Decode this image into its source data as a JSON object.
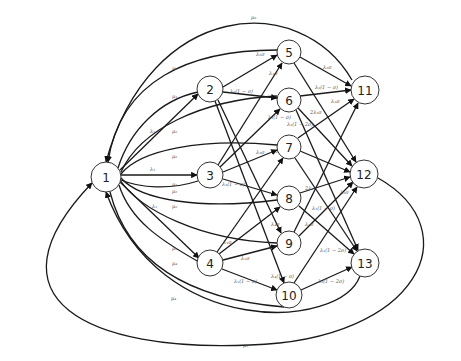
{
  "diagram": {
    "type": "state-transition-graph",
    "nodes": [
      {
        "id": "1",
        "label": "1",
        "x": 106,
        "y": 177,
        "r": 15
      },
      {
        "id": "2",
        "label": "2",
        "x": 210,
        "y": 89,
        "r": 13
      },
      {
        "id": "3",
        "label": "3",
        "x": 210,
        "y": 175,
        "r": 13
      },
      {
        "id": "4",
        "label": "4",
        "x": 210,
        "y": 263,
        "r": 13
      },
      {
        "id": "5",
        "label": "5",
        "x": 289,
        "y": 52,
        "r": 12
      },
      {
        "id": "6",
        "label": "6",
        "x": 289,
        "y": 100,
        "r": 12
      },
      {
        "id": "7",
        "label": "7",
        "x": 289,
        "y": 147,
        "r": 12
      },
      {
        "id": "8",
        "label": "8",
        "x": 289,
        "y": 198,
        "r": 12
      },
      {
        "id": "9",
        "label": "9",
        "x": 289,
        "y": 243,
        "r": 12
      },
      {
        "id": "10",
        "label": "10",
        "x": 289,
        "y": 295,
        "r": 13
      },
      {
        "id": "11",
        "label": "11",
        "x": 365,
        "y": 90,
        "r": 14
      },
      {
        "id": "12",
        "label": "12",
        "x": 364,
        "y": 174,
        "r": 14
      },
      {
        "id": "13",
        "label": "13",
        "x": 365,
        "y": 263,
        "r": 14
      }
    ],
    "edges": [
      {
        "from": "1",
        "to": "2",
        "label": "λ₁",
        "lx": 150,
        "ly": 133
      },
      {
        "from": "1",
        "to": "3",
        "label": "λ₁",
        "lx": 150,
        "ly": 171
      },
      {
        "from": "1",
        "to": "4",
        "label": "λ₁",
        "lx": 152,
        "ly": 208
      },
      {
        "from": "2",
        "to": "1",
        "label": "μ₁",
        "lx": 172,
        "ly": 98
      },
      {
        "from": "3",
        "to": "1",
        "label": "μ₁",
        "lx": 172,
        "ly": 186
      },
      {
        "from": "4",
        "to": "1",
        "label": "μ₁",
        "lx": 172,
        "ly": 250
      },
      {
        "from": "5",
        "to": "1",
        "label": "μ₂",
        "lx": 172,
        "ly": 70
      },
      {
        "from": "6",
        "to": "1",
        "label": "μ₂",
        "lx": 172,
        "ly": 133
      },
      {
        "from": "7",
        "to": "1",
        "label": "μ₂",
        "lx": 172,
        "ly": 158
      },
      {
        "from": "8",
        "to": "1",
        "label": "μ₂",
        "lx": 172,
        "ly": 193
      },
      {
        "from": "9",
        "to": "1",
        "label": "μ₂",
        "lx": 172,
        "ly": 208
      },
      {
        "from": "10",
        "to": "1",
        "label": "μ₄",
        "lx": 172,
        "ly": 265
      },
      {
        "from": "11",
        "to": "1",
        "label": "μ₃",
        "lx": 251,
        "ly": 19
      },
      {
        "from": "12",
        "to": "1",
        "label": "μ₃",
        "lx": 243,
        "ly": 347
      },
      {
        "from": "13",
        "to": "1",
        "label": "μ₄",
        "lx": 171,
        "ly": 300
      },
      {
        "from": "2",
        "to": "5",
        "label": "λ₂σ",
        "lx": 256,
        "ly": 56
      },
      {
        "from": "2",
        "to": "6",
        "label": "λ₂(1 − σ)",
        "lx": 230,
        "ly": 93
      },
      {
        "from": "2",
        "to": "9",
        "label": "",
        "lx": 0,
        "ly": 0
      },
      {
        "from": "2",
        "to": "10",
        "label": "",
        "lx": 0,
        "ly": 0
      },
      {
        "from": "3",
        "to": "5",
        "label": "λ₁σ",
        "lx": 269,
        "ly": 75
      },
      {
        "from": "3",
        "to": "6",
        "label": "λ₁(1 − σ)",
        "lx": 268,
        "ly": 119
      },
      {
        "from": "3",
        "to": "7",
        "label": "λ₃σ",
        "lx": 256,
        "ly": 154
      },
      {
        "from": "3",
        "to": "8",
        "label": "λ₃(1 − σ)",
        "lx": 222,
        "ly": 186
      },
      {
        "from": "4",
        "to": "7",
        "label": "λ₁σ",
        "lx": 223,
        "ly": 244
      },
      {
        "from": "4",
        "to": "8",
        "label": "",
        "lx": 0,
        "ly": 0
      },
      {
        "from": "4",
        "to": "9",
        "label": "λ₁σ",
        "lx": 241,
        "ly": 260
      },
      {
        "from": "4",
        "to": "10",
        "label": "λ₁(1 − σ)",
        "lx": 234,
        "ly": 283
      },
      {
        "from": "5",
        "to": "11",
        "label": "λ₂σ",
        "lx": 323,
        "ly": 69
      },
      {
        "from": "5",
        "to": "12",
        "label": "",
        "lx": 0,
        "ly": 0
      },
      {
        "from": "6",
        "to": "11",
        "label": "λ₂(1 − σ)",
        "lx": 315,
        "ly": 89
      },
      {
        "from": "6",
        "to": "12",
        "label": "2λ₁σ",
        "lx": 310,
        "ly": 114
      },
      {
        "from": "6",
        "to": "13",
        "label": "λ₂(1 − 2σ)",
        "lx": 287,
        "ly": 126
      },
      {
        "from": "7",
        "to": "11",
        "label": "λ₁σ",
        "lx": 331,
        "ly": 103
      },
      {
        "from": "7",
        "to": "12",
        "label": "λ₂(1 − σ)",
        "lx": 276,
        "ly": 153
      },
      {
        "from": "8",
        "to": "12",
        "label": "2λ₁",
        "lx": 305,
        "ly": 190
      },
      {
        "from": "8",
        "to": "13",
        "label": "λ₁(1 − σ)",
        "lx": 312,
        "ly": 210
      },
      {
        "from": "9",
        "to": "12",
        "label": "λ₂σ",
        "lx": 305,
        "ly": 226
      },
      {
        "from": "9",
        "to": "11",
        "label": "",
        "lx": 0,
        "ly": 0
      },
      {
        "from": "10",
        "to": "12",
        "label": "",
        "lx": 0,
        "ly": 0
      },
      {
        "from": "10",
        "to": "13",
        "label": "λ₂(1 − 2σ)",
        "lx": 318,
        "ly": 283
      },
      {
        "from": "2",
        "to": "12",
        "label": "λ₂σ",
        "lx": 340,
        "ly": 194
      },
      {
        "from": "9",
        "to": "13",
        "label": "λ₁(1 − 2σ)",
        "lx": 320,
        "ly": 252
      },
      {
        "from": "4",
        "to": "10",
        "label": "λ₄(1 − σ)",
        "lx": 271,
        "ly": 278
      },
      {
        "from": "3",
        "to": "9",
        "label": "λ₄σ",
        "lx": 271,
        "ly": 226
      },
      {
        "from": "7",
        "to": "13",
        "label": "",
        "lx": 0,
        "ly": 0
      }
    ]
  }
}
